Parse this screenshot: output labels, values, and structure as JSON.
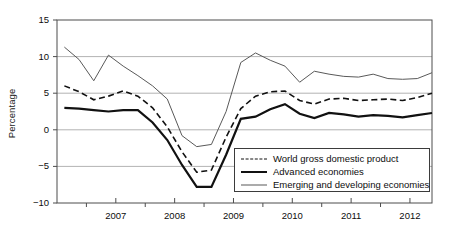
{
  "chart_data": {
    "type": "line",
    "title": "",
    "xlabel": "",
    "ylabel": "Percentage",
    "ylim": [
      -10,
      15
    ],
    "yticks": [
      15,
      10,
      5,
      0,
      -5,
      -10
    ],
    "ytick_labels": [
      "15",
      "10",
      "5",
      "0",
      "−5",
      "−10"
    ],
    "xlim": [
      2006.5,
      2012.875
    ],
    "xticks": [
      2007,
      2008,
      2009,
      2010,
      2011,
      2012
    ],
    "xtick_labels": [
      "2007",
      "2008",
      "2009",
      "2010",
      "2011",
      "2012"
    ],
    "minor_xticks": [
      2007.5,
      2008.5,
      2009.5,
      2010.5,
      2011.5,
      2012.5
    ],
    "grid": "horizontal",
    "gridlines": [
      10,
      5,
      0,
      -5
    ],
    "legend_position": "bottom-right",
    "x": [
      2006.625,
      2006.875,
      2007.125,
      2007.375,
      2007.625,
      2007.875,
      2008.125,
      2008.375,
      2008.625,
      2008.875,
      2009.125,
      2009.375,
      2009.625,
      2009.875,
      2010.125,
      2010.375,
      2010.625,
      2010.875,
      2011.125,
      2011.375,
      2011.625,
      2011.875,
      2012.125,
      2012.375,
      2012.625,
      2012.875
    ],
    "series": [
      {
        "name": "World gross domestic product",
        "style": "dashed",
        "color": "#111111",
        "width": 1.6,
        "values": [
          6.0,
          5.2,
          4.1,
          4.6,
          5.3,
          4.6,
          3.0,
          0.4,
          -3.0,
          -5.8,
          -5.5,
          -1.0,
          2.9,
          4.6,
          5.2,
          5.3,
          4.0,
          3.5,
          4.2,
          4.3,
          4.0,
          4.1,
          4.2,
          4.0,
          4.4,
          5.0
        ]
      },
      {
        "name": "Advanced economies",
        "style": "solid",
        "color": "#111111",
        "width": 2.2,
        "values": [
          3.0,
          2.9,
          2.7,
          2.5,
          2.7,
          2.7,
          1.0,
          -1.4,
          -4.8,
          -7.8,
          -7.8,
          -3.4,
          1.5,
          1.8,
          2.8,
          3.5,
          2.2,
          1.6,
          2.3,
          2.1,
          1.8,
          2.0,
          1.9,
          1.7,
          2.0,
          2.3
        ]
      },
      {
        "name": "Emerging and developing economies",
        "style": "solid",
        "color": "#595959",
        "width": 1.0,
        "values": [
          11.3,
          9.6,
          6.7,
          10.2,
          8.7,
          7.4,
          6.0,
          4.2,
          -0.8,
          -2.3,
          -2.0,
          2.5,
          9.2,
          10.5,
          9.5,
          8.7,
          6.5,
          8.0,
          7.6,
          7.3,
          7.2,
          7.6,
          7.0,
          6.9,
          7.0,
          7.8
        ]
      }
    ]
  },
  "ylabel_text": "Percentage",
  "legend": {
    "items": [
      {
        "label": "World gross domestic product",
        "key": "dashed"
      },
      {
        "label": "Advanced economies",
        "key": "thick-solid"
      },
      {
        "label": "Emerging and developing economies",
        "key": "thin-solid"
      }
    ]
  }
}
